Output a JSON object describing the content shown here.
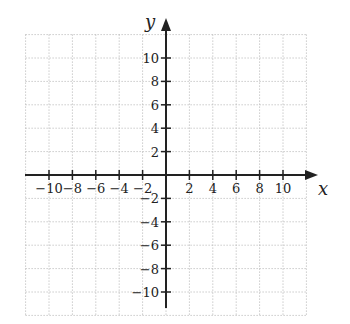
{
  "chart_data": {
    "type": "coordinate-grid",
    "title": "",
    "xlabel": "x",
    "ylabel": "y",
    "xlim": [
      -12,
      12
    ],
    "ylim": [
      -12,
      12
    ],
    "grid": "dotted, every 2 units",
    "x_ticks": [
      -10,
      -8,
      -6,
      -4,
      -2,
      2,
      4,
      6,
      8,
      10
    ],
    "y_ticks": [
      10,
      8,
      6,
      4,
      2,
      -2,
      -4,
      -6,
      -8,
      -10
    ],
    "x_tick_labels": [
      "−10",
      "−8",
      "−6",
      "−4",
      "−2",
      "2",
      "4",
      "6",
      "8",
      "10"
    ],
    "y_tick_labels": [
      "10",
      "8",
      "6",
      "4",
      "2",
      "−2",
      "−4",
      "−6",
      "−8",
      "−10"
    ]
  },
  "colors": {
    "axis": "#222222",
    "grid": "#b0b0b0"
  }
}
